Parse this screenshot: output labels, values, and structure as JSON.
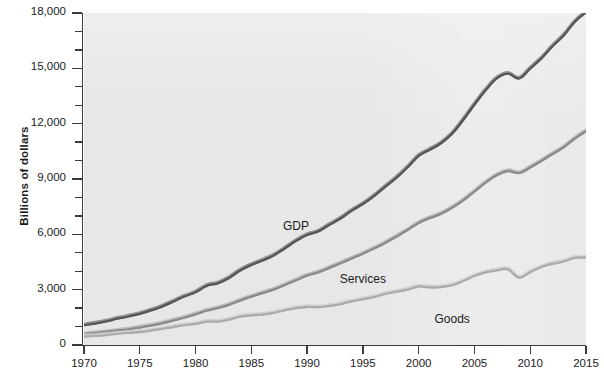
{
  "chart_data": {
    "type": "line",
    "title": "",
    "xlabel": "",
    "ylabel": "Billions of dollars",
    "xlim": [
      1970,
      2015
    ],
    "ylim": [
      0,
      18000
    ],
    "grid": false,
    "legend_position": "inline-annotations",
    "y_tick_labels": [
      "18,000",
      "15,000",
      "12,000",
      "9,000",
      "6,000",
      "3,000",
      "0"
    ],
    "y_tick_values": [
      18000,
      15000,
      12000,
      9000,
      6000,
      3000,
      0
    ],
    "y_minor_interval": 1000,
    "x_tick_labels": [
      "1970",
      "1975",
      "1980",
      "1985",
      "1990",
      "1995",
      "2000",
      "2005",
      "2010",
      "2015"
    ],
    "x_tick_values": [
      1970,
      1975,
      1980,
      1985,
      1990,
      1995,
      2000,
      2005,
      2010,
      2015
    ],
    "x": [
      1970,
      1971,
      1972,
      1973,
      1974,
      1975,
      1976,
      1977,
      1978,
      1979,
      1980,
      1981,
      1982,
      1983,
      1984,
      1985,
      1986,
      1987,
      1988,
      1989,
      1990,
      1991,
      1992,
      1993,
      1994,
      1995,
      1996,
      1997,
      1998,
      1999,
      2000,
      2001,
      2002,
      2003,
      2004,
      2005,
      2006,
      2007,
      2008,
      2009,
      2010,
      2011,
      2012,
      2013,
      2014,
      2015
    ],
    "series": [
      {
        "name": "GDP",
        "color": "#565656",
        "highlight_color": "#8f8f8f",
        "label_x": 1989,
        "label_y": 6450,
        "values": [
          1073,
          1165,
          1279,
          1425,
          1545,
          1685,
          1873,
          2082,
          2352,
          2627,
          2857,
          3207,
          3344,
          3634,
          4038,
          4339,
          4580,
          4855,
          5236,
          5642,
          5963,
          6158,
          6520,
          6859,
          7287,
          7640,
          8073,
          8578,
          9063,
          9631,
          10252,
          10582,
          10936,
          11458,
          12214,
          13037,
          13815,
          14452,
          14713,
          14449,
          14992,
          15543,
          16197,
          16785,
          17522,
          18037
        ]
      },
      {
        "name": "Services",
        "color": "#8a8a8a",
        "highlight_color": "#b9b9b9",
        "label_x": 1995,
        "label_y": 3580,
        "values": [
          590,
          643,
          706,
          780,
          852,
          946,
          1050,
          1170,
          1320,
          1477,
          1655,
          1860,
          1995,
          2180,
          2410,
          2620,
          2810,
          3000,
          3250,
          3510,
          3760,
          3940,
          4180,
          4430,
          4690,
          4950,
          5230,
          5530,
          5870,
          6230,
          6620,
          6880,
          7110,
          7440,
          7840,
          8320,
          8800,
          9200,
          9430,
          9320,
          9620,
          9980,
          10350,
          10720,
          11190,
          11600
        ]
      },
      {
        "name": "Goods",
        "color": "#ababab",
        "highlight_color": "#d2d2d2",
        "label_x": 2003,
        "label_y": 1430,
        "values": [
          460,
          492,
          540,
          608,
          660,
          705,
          780,
          870,
          975,
          1075,
          1140,
          1270,
          1270,
          1370,
          1540,
          1610,
          1650,
          1740,
          1880,
          2000,
          2060,
          2050,
          2120,
          2210,
          2370,
          2480,
          2600,
          2770,
          2880,
          3000,
          3170,
          3120,
          3140,
          3240,
          3470,
          3740,
          3940,
          4050,
          4100,
          3650,
          3950,
          4230,
          4400,
          4530,
          4730,
          4740
        ]
      }
    ],
    "annotations": [
      {
        "text": "GDP",
        "series": "GDP"
      },
      {
        "text": "Services",
        "series": "Services"
      },
      {
        "text": "Goods",
        "series": "Goods"
      }
    ]
  },
  "axes": {
    "y_title": "Billions of dollars"
  }
}
